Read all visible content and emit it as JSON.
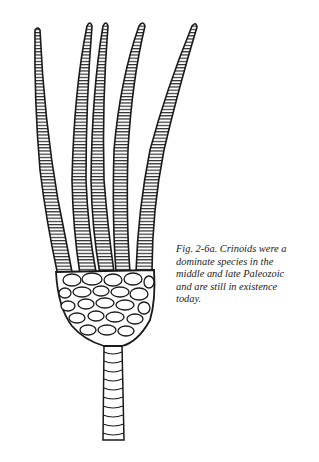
{
  "figure": {
    "label": "Fig. 2-6a.",
    "caption_lines": [
      "Fig. 2-6a.  Crinoids were a",
      "dominate species in the",
      "middle and late Paleozoic",
      "and are still in existence",
      "today."
    ],
    "ink_color": "#1a1a1a",
    "background": "#ffffff",
    "arms": [
      {
        "tip": [
          37,
          28
        ],
        "base": [
          64,
          268
        ]
      },
      {
        "tip": [
          89,
          24
        ],
        "base": [
          88,
          272
        ]
      },
      {
        "tip": [
          105,
          24
        ],
        "base": [
          107,
          272
        ]
      },
      {
        "tip": [
          141,
          24
        ],
        "base": [
          122,
          272
        ]
      },
      {
        "tip": [
          194,
          24
        ],
        "base": [
          144,
          270
        ]
      }
    ]
  }
}
